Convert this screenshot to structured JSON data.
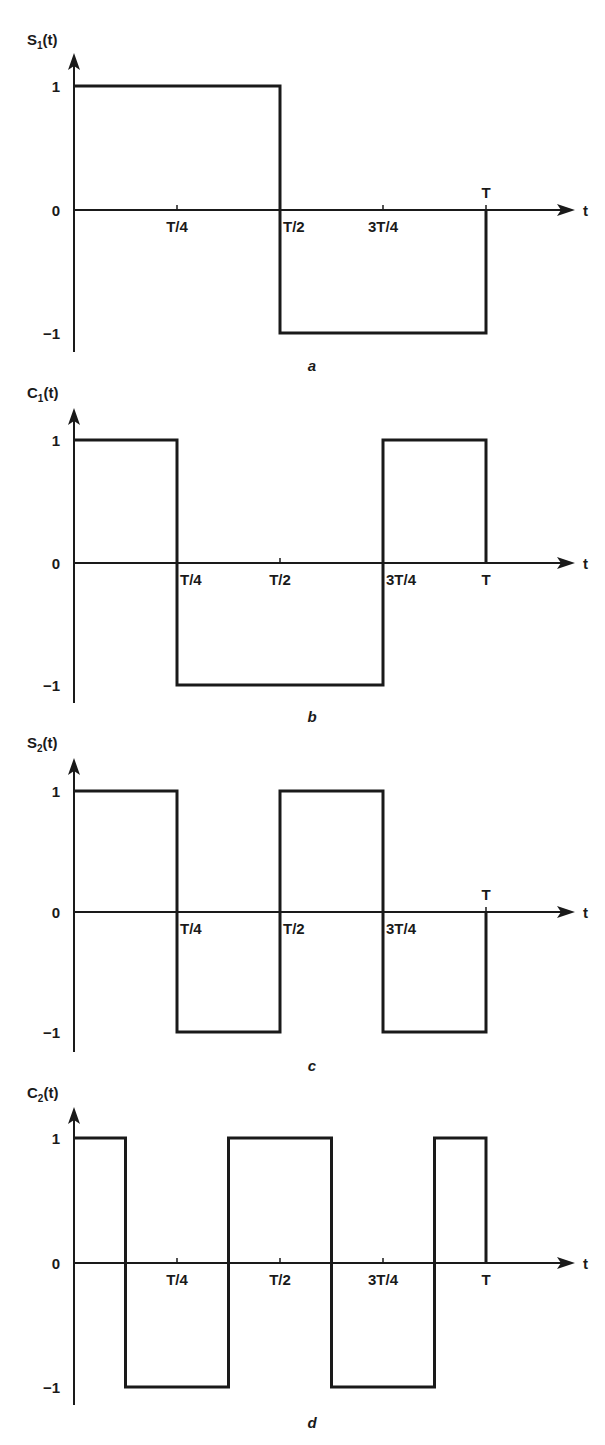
{
  "figure": {
    "panels": [
      {
        "id": "a",
        "caption": "a",
        "title_main": "S",
        "title_sub": "1",
        "title_tail": "(t)",
        "y_labels": [
          "1",
          "0",
          "−1"
        ],
        "x_axis_label": "t",
        "x_ticks": [
          {
            "label": "T/4",
            "pos": "below"
          },
          {
            "label": "T/2",
            "pos": "below"
          },
          {
            "label": "3T/4",
            "pos": "below"
          },
          {
            "label": "T",
            "pos": "above"
          }
        ]
      },
      {
        "id": "b",
        "caption": "b",
        "title_main": "C",
        "title_sub": "1",
        "title_tail": "(t)",
        "y_labels": [
          "1",
          "0",
          "−1"
        ],
        "x_axis_label": "t",
        "x_ticks": [
          {
            "label": "T/4",
            "pos": "below"
          },
          {
            "label": "T/2",
            "pos": "below"
          },
          {
            "label": "3T/4",
            "pos": "below"
          },
          {
            "label": "T",
            "pos": "below"
          }
        ]
      },
      {
        "id": "c",
        "caption": "c",
        "title_main": "S",
        "title_sub": "2",
        "title_tail": "(t)",
        "y_labels": [
          "1",
          "0",
          "−1"
        ],
        "x_axis_label": "t",
        "x_ticks": [
          {
            "label": "T/4",
            "pos": "below"
          },
          {
            "label": "T/2",
            "pos": "below"
          },
          {
            "label": "3T/4",
            "pos": "below"
          },
          {
            "label": "T",
            "pos": "above"
          }
        ]
      },
      {
        "id": "d",
        "caption": "d",
        "title_main": "C",
        "title_sub": "2",
        "title_tail": "(t)",
        "y_labels": [
          "1",
          "0",
          "−1"
        ],
        "x_axis_label": "t",
        "x_ticks": [
          {
            "label": "T/4",
            "pos": "below"
          },
          {
            "label": "T/2",
            "pos": "below"
          },
          {
            "label": "3T/4",
            "pos": "below"
          },
          {
            "label": "T",
            "pos": "below"
          }
        ]
      }
    ]
  },
  "chart_data": [
    {
      "type": "line",
      "title": "S1(t)",
      "caption": "a",
      "xlabel": "t",
      "ylabel": "S1(t)",
      "x_tick_labels": [
        "T/4",
        "T/2",
        "3T/4",
        "T"
      ],
      "y_tick_labels": [
        "1",
        "0",
        "-1"
      ],
      "ylim": [
        -1,
        1
      ],
      "x_units": "fraction of T",
      "segments": [
        {
          "t_start": 0,
          "t_end": 0.5,
          "value": 1
        },
        {
          "t_start": 0.5,
          "t_end": 1,
          "value": -1
        }
      ]
    },
    {
      "type": "line",
      "title": "C1(t)",
      "caption": "b",
      "xlabel": "t",
      "ylabel": "C1(t)",
      "x_tick_labels": [
        "T/4",
        "T/2",
        "3T/4",
        "T"
      ],
      "y_tick_labels": [
        "1",
        "0",
        "-1"
      ],
      "ylim": [
        -1,
        1
      ],
      "x_units": "fraction of T",
      "segments": [
        {
          "t_start": 0,
          "t_end": 0.25,
          "value": 1
        },
        {
          "t_start": 0.25,
          "t_end": 0.75,
          "value": -1
        },
        {
          "t_start": 0.75,
          "t_end": 1,
          "value": 1
        }
      ]
    },
    {
      "type": "line",
      "title": "S2(t)",
      "caption": "c",
      "xlabel": "t",
      "ylabel": "S2(t)",
      "x_tick_labels": [
        "T/4",
        "T/2",
        "3T/4",
        "T"
      ],
      "y_tick_labels": [
        "1",
        "0",
        "-1"
      ],
      "ylim": [
        -1,
        1
      ],
      "x_units": "fraction of T",
      "segments": [
        {
          "t_start": 0,
          "t_end": 0.25,
          "value": 1
        },
        {
          "t_start": 0.25,
          "t_end": 0.5,
          "value": -1
        },
        {
          "t_start": 0.5,
          "t_end": 0.75,
          "value": 1
        },
        {
          "t_start": 0.75,
          "t_end": 1,
          "value": -1
        }
      ]
    },
    {
      "type": "line",
      "title": "C2(t)",
      "caption": "d",
      "xlabel": "t",
      "ylabel": "C2(t)",
      "x_tick_labels": [
        "T/4",
        "T/2",
        "3T/4",
        "T"
      ],
      "y_tick_labels": [
        "1",
        "0",
        "-1"
      ],
      "ylim": [
        -1,
        1
      ],
      "x_units": "fraction of T",
      "segments": [
        {
          "t_start": 0,
          "t_end": 0.125,
          "value": 1
        },
        {
          "t_start": 0.125,
          "t_end": 0.375,
          "value": -1
        },
        {
          "t_start": 0.375,
          "t_end": 0.625,
          "value": 1
        },
        {
          "t_start": 0.625,
          "t_end": 0.875,
          "value": -1
        },
        {
          "t_start": 0.875,
          "t_end": 1,
          "value": 1
        }
      ]
    }
  ]
}
